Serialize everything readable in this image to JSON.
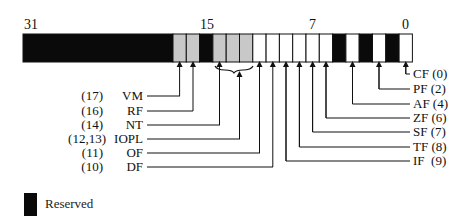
{
  "bit_markers": [
    {
      "label": "31",
      "bit": 31
    },
    {
      "label": "15",
      "bit": 15
    },
    {
      "label": "7",
      "bit": 7
    },
    {
      "label": "0",
      "bit": 0
    }
  ],
  "colors": {
    "reserved": "#0a0a0a",
    "system_flag": "#c8c8c8",
    "status_flag": "#ffffff",
    "outline": "#111111"
  },
  "cells": [
    {
      "bits": "31-18",
      "type": "reserved"
    },
    {
      "bits": "17",
      "type": "system_flag"
    },
    {
      "bits": "16",
      "type": "system_flag"
    },
    {
      "bits": "15",
      "type": "reserved"
    },
    {
      "bits": "14",
      "type": "system_flag"
    },
    {
      "bits": "13",
      "type": "system_flag"
    },
    {
      "bits": "12",
      "type": "system_flag"
    },
    {
      "bits": "11",
      "type": "status_flag"
    },
    {
      "bits": "10",
      "type": "status_flag"
    },
    {
      "bits": "9",
      "type": "status_flag"
    },
    {
      "bits": "8",
      "type": "status_flag"
    },
    {
      "bits": "7",
      "type": "status_flag"
    },
    {
      "bits": "6",
      "type": "status_flag"
    },
    {
      "bits": "5",
      "type": "reserved"
    },
    {
      "bits": "4",
      "type": "status_flag"
    },
    {
      "bits": "3",
      "type": "reserved"
    },
    {
      "bits": "2",
      "type": "status_flag"
    },
    {
      "bits": "1",
      "type": "reserved"
    },
    {
      "bits": "0",
      "type": "status_flag"
    }
  ],
  "left_flags": [
    {
      "num": "(17)",
      "name": "VM"
    },
    {
      "num": "(16)",
      "name": "RF"
    },
    {
      "num": "(14)",
      "name": "NT"
    },
    {
      "num": "(12,13)",
      "name": "IOPL"
    },
    {
      "num": "(11)",
      "name": "OF"
    },
    {
      "num": "(10)",
      "name": "DF"
    }
  ],
  "right_flags": [
    {
      "label": "CF (0)"
    },
    {
      "label": "PF (2)"
    },
    {
      "label": "AF (4)"
    },
    {
      "label": "ZF (6)"
    },
    {
      "label": "SF (7)"
    },
    {
      "label": "TF (8)"
    },
    {
      "label": "IF  (9)"
    }
  ],
  "legend": {
    "label": "Reserved"
  }
}
